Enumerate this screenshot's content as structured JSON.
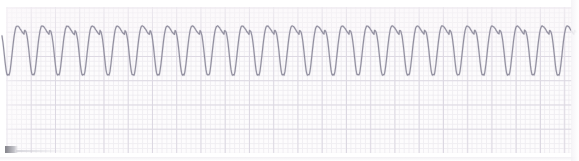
{
  "strip": {
    "title": "ECG Rhythm Strip",
    "paper_color": "#fdfcfd",
    "fine_grid_color": "#e4e1e8",
    "major_grid_color": "#dcd8e2",
    "trace_color": "#8d8a9b",
    "smudge_label": "scanner-artifact"
  },
  "chart_data": {
    "type": "line",
    "subtitle": "Monomorphic wide-complex tachycardia (sine-wave morphology)",
    "xlabel": "",
    "ylabel": "",
    "grid": true,
    "legend_position": "none",
    "annotations": [],
    "axis": {
      "x_px_range": [
        6,
        572
      ],
      "y_px_range": [
        7,
        153
      ],
      "major_grid_px": 24.25,
      "minor_grid_px": 4.85
    },
    "waveform": {
      "morphology": "sine-wave / monomorphic VT",
      "cycles": 22,
      "period_px": 25.0,
      "first_peak_x_px": 17,
      "peak_y_px": 26,
      "trough_y_px": 75,
      "baseline_y_px": 50,
      "amplitude_px": 24.5,
      "peak_flat_fraction": 0.22,
      "trough_sharpness": 0.78,
      "upstroke_fraction": 0.34
    },
    "peaks_x_px": [
      17,
      42,
      67,
      92,
      117,
      142,
      167,
      192,
      217,
      242,
      267,
      292,
      317,
      342,
      367,
      392,
      417,
      442,
      467,
      492,
      517,
      542,
      567
    ],
    "troughs_x_px": [
      30,
      55,
      80,
      105,
      130,
      155,
      180,
      205,
      230,
      255,
      280,
      305,
      330,
      355,
      380,
      405,
      430,
      455,
      480,
      505,
      530,
      555
    ],
    "series": [
      {
        "name": "Lead II",
        "units": "mV",
        "values_description": "Regular large-amplitude sinusoidal deflections, ~22 complexes across the 566 px strip, no discernible isoelectric baseline between complexes."
      }
    ]
  }
}
